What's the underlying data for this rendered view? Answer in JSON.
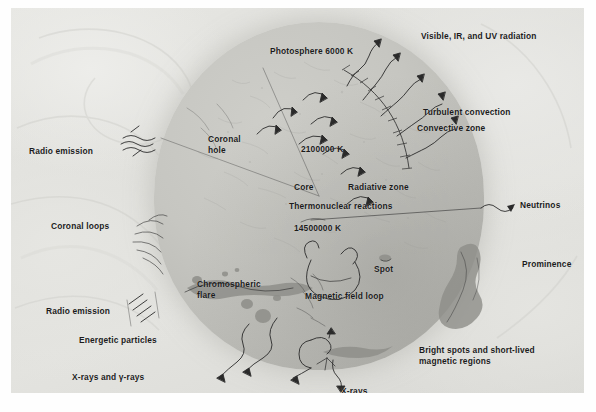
{
  "figure": {
    "type": "annotated cut-away diagram of the Sun (scanned textbook plate)"
  },
  "labels": {
    "photosphere": "Photosphere 6000 K",
    "radiation": "Visible, IR, and UV radiation",
    "turbulent_convection": "Turbulent convection",
    "convective_zone": "Convective zone",
    "temp_convective": "2100000 K",
    "coronal_hole": "Coronal\nhole",
    "radio_emission_top": "Radio emission",
    "core": "Core",
    "radiative_zone": "Radiative zone",
    "thermonuclear": "Thermonuclear reactions",
    "temp_core": "14500000 K",
    "neutrinos": "Neutrinos",
    "coronal_loops": "Coronal loops",
    "chromospheric_flare": "Chromospheric\nflare",
    "spot": "Spot",
    "magnetic_field_loop": "Magnetic field loop",
    "prominence": "Prominence",
    "radio_emission_bottom": "Radio emission",
    "energetic_particles": "Energetic particles",
    "xrays_gamma": "X-rays and γ-rays",
    "bright_spots": "Bright spots and short-lived\nmagnetic regions",
    "xrays": "X-rays"
  },
  "temperatures": [
    {
      "zone": "Photosphere",
      "value": "6000 K"
    },
    {
      "zone": "Convective zone",
      "value": "2100000 K"
    },
    {
      "zone": "Core",
      "value": "14500000 K"
    }
  ],
  "icons": {
    "radiation_arrow": "wavy-arrow-icon",
    "convection_cell": "curved-arrow-icon",
    "neutrino_arrow": "wavy-arrow-icon",
    "radio_wave": "wavy-lines-icon",
    "particle_arrow": "wavy-arrow-icon",
    "loop": "magnetic-loop-icon"
  },
  "colors": {
    "ink": "#2a2a2a",
    "disc": "#c6c6c1",
    "background": "#e3e3df",
    "paper": "#fefefe"
  }
}
